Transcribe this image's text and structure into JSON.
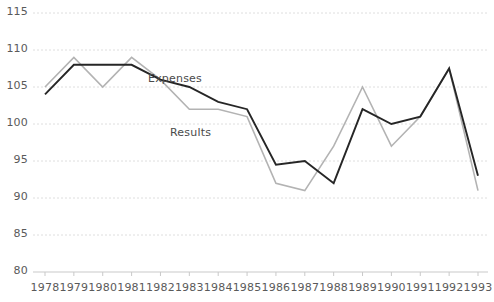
{
  "chart_data": {
    "type": "line",
    "title": "",
    "subtitle": "",
    "xlabel": "",
    "ylabel": "",
    "categories": [
      "1978",
      "1979",
      "1980",
      "1981",
      "1982",
      "1983",
      "1984",
      "1985",
      "1986",
      "1987",
      "1988",
      "1989",
      "1990",
      "1991",
      "1992",
      "1993"
    ],
    "ylim": [
      80,
      115
    ],
    "y_ticks": [
      80,
      85,
      90,
      95,
      100,
      105,
      110,
      115
    ],
    "y_tick_labels": [
      "80",
      "85",
      "90",
      "95",
      "100",
      "105",
      "110",
      "115"
    ],
    "grid": "horizontal-dashed",
    "legend_position": "inline-annotations",
    "series": [
      {
        "name": "Expenses",
        "color": "#b3b3b3",
        "values": [
          105,
          109,
          105,
          109,
          106,
          102,
          102,
          101,
          92,
          91,
          97,
          105,
          97,
          101,
          107.5,
          91
        ]
      },
      {
        "name": "Results",
        "color": "#262626",
        "values": [
          104,
          108,
          108,
          108,
          106,
          105,
          103,
          102,
          94.5,
          95,
          92,
          102,
          100,
          101,
          107.5,
          93
        ]
      }
    ],
    "annotations": [
      {
        "text": "Expenses",
        "x_px": 148,
        "y_px": 72
      },
      {
        "text": "Results",
        "x_px": 170,
        "y_px": 126
      }
    ]
  }
}
